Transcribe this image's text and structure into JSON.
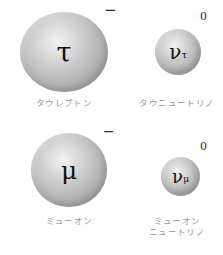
{
  "diagram": {
    "type": "particle-illustration",
    "background_color": "#ffffff",
    "sphere_color": "#b5b5b5",
    "caption_color": "#9a9a9a",
    "symbol_color": "#111111"
  },
  "particles": [
    {
      "id": "tau-lepton",
      "symbol_base": "τ",
      "symbol_subscript": "",
      "charge": "−",
      "caption": "タウレプトン",
      "size": "large"
    },
    {
      "id": "tau-neutrino",
      "symbol_base": "ν",
      "symbol_subscript": "τ",
      "charge": "0",
      "caption": "タウニュートリノ",
      "size": "small"
    },
    {
      "id": "muon",
      "symbol_base": "μ",
      "symbol_subscript": "",
      "charge": "−",
      "caption": "ミューオン",
      "size": "large"
    },
    {
      "id": "muon-neutrino",
      "symbol_base": "ν",
      "symbol_subscript": "μ",
      "charge": "0",
      "caption": "ミューオン\nニュートリノ",
      "size": "small"
    }
  ]
}
